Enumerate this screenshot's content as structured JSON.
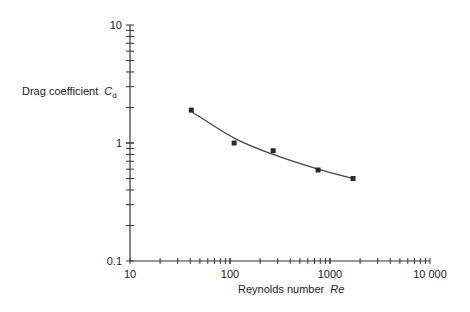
{
  "chart_data": {
    "type": "scatter",
    "title": "",
    "xlabel": "Reynolds number",
    "xlabel_symbol": "Re",
    "ylabel": "Drag coefficient",
    "ylabel_symbol": "C",
    "ylabel_subscript": "d",
    "xscale": "log",
    "yscale": "log",
    "xlim": [
      10,
      10000
    ],
    "ylim": [
      0.1,
      10
    ],
    "x_ticks": [
      10,
      100,
      1000,
      10000
    ],
    "x_tick_labels": [
      "10",
      "100",
      "1000",
      "10 000"
    ],
    "y_ticks": [
      0.1,
      1,
      10
    ],
    "y_tick_labels": [
      "0.1",
      "1",
      "10"
    ],
    "grid": false,
    "legend": null,
    "series": [
      {
        "name": "measured",
        "marker": "square",
        "x": [
          41,
          110,
          270,
          760,
          1700
        ],
        "y": [
          1.9,
          1.0,
          0.86,
          0.59,
          0.5
        ]
      },
      {
        "name": "fit curve",
        "marker": "none",
        "line": "smooth",
        "x": [
          41,
          110,
          270,
          760,
          1700
        ],
        "y": [
          1.85,
          1.1,
          0.8,
          0.6,
          0.5
        ]
      }
    ]
  },
  "labels": {
    "y_axis_text": "Drag coefficient",
    "y_axis_symbol": "C",
    "y_axis_sub": "d",
    "x_axis_text": "Reynolds number",
    "x_axis_symbol": "Re"
  },
  "colors": {
    "axis": "#333333",
    "marker": "#2a2a2a",
    "curve": "#444444"
  }
}
